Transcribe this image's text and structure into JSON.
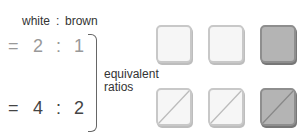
{
  "header": {
    "left": "white",
    "sep": ":",
    "right": "brown"
  },
  "ratios": [
    {
      "eq": "=",
      "a": "2",
      "sep": ":",
      "b": "1",
      "color": "#999999"
    },
    {
      "eq": "=",
      "a": "4",
      "sep": ":",
      "b": "2",
      "color": "#444444"
    }
  ],
  "note": {
    "line1": "equivalent",
    "line2": "ratios"
  },
  "squares": {
    "top": [
      "white",
      "white",
      "brown"
    ],
    "bottom": [
      "white-split",
      "white-split",
      "brown-split"
    ]
  },
  "colors": {
    "white_fill": "#f6f6f6",
    "brown_fill": "#b4b4b4",
    "white_border": "#c8c8c8",
    "brown_border": "#8e8e8e"
  }
}
